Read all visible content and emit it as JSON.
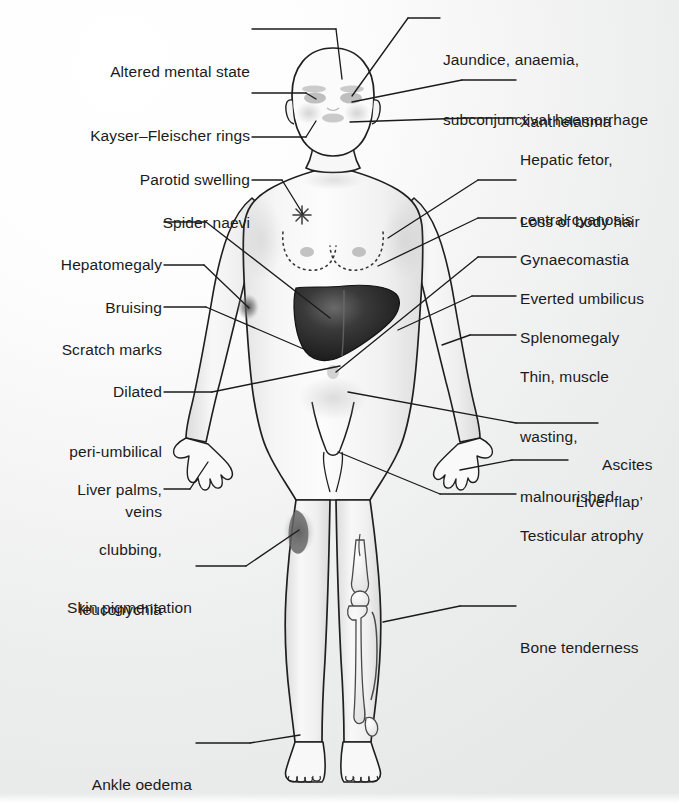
{
  "figure": {
    "background_color": "#ececec",
    "ink_color": "#1b1b1b",
    "skin_color": "#f7f7f7",
    "liver_color": "#2a2a2a"
  },
  "labels_left": [
    {
      "id": "altered-mental-state",
      "lines": [
        "Altered mental state"
      ],
      "x": 50,
      "y": 22,
      "width": 200
    },
    {
      "id": "kayser-fleischer-rings",
      "lines": [
        "Kayser–Fleischer rings"
      ],
      "x": 22,
      "y": 86,
      "width": 228
    },
    {
      "id": "parotid-swelling",
      "lines": [
        "Parotid swelling"
      ],
      "x": 92,
      "y": 130,
      "width": 158
    },
    {
      "id": "spider-naevi",
      "lines": [
        "Spider naevi"
      ],
      "x": 108,
      "y": 173,
      "width": 142
    },
    {
      "id": "hepatomegaly",
      "lines": [
        "Hepatomegaly"
      ],
      "x": 28,
      "y": 215,
      "width": 134
    },
    {
      "id": "bruising",
      "lines": [
        "Bruising"
      ],
      "x": 74,
      "y": 258,
      "width": 88
    },
    {
      "id": "scratch-marks",
      "lines": [
        "Scratch marks"
      ],
      "x": 28,
      "y": 300,
      "width": 134
    },
    {
      "id": "dilated-peri-umbilical-veins",
      "lines": [
        "Dilated",
        "peri-umbilical",
        "veins"
      ],
      "x": 28,
      "y": 342,
      "width": 134
    },
    {
      "id": "liver-palms-clubbing-leuconychia",
      "lines": [
        "Liver palms,",
        "clubbing,",
        "leuconychia"
      ],
      "x": 40,
      "y": 440,
      "width": 122
    },
    {
      "id": "skin-pigmentation",
      "lines": [
        "Skin pigmentation"
      ],
      "x": 52,
      "y": 558,
      "width": 140
    },
    {
      "id": "ankle-oedema",
      "lines": [
        "Ankle oedema"
      ],
      "x": 80,
      "y": 735,
      "width": 112
    }
  ],
  "labels_right": [
    {
      "id": "jaundice-anaemia-subconjunctival-haemorrhage",
      "lines": [
        "Jaundice, anaemia,",
        "subconjunctival haemorrhage"
      ],
      "x": 443,
      "y": 10
    },
    {
      "id": "xanthelasma",
      "lines": [
        "Xanthelasma"
      ],
      "x": 520,
      "y": 72
    },
    {
      "id": "hepatic-fetor-central-cyanosis",
      "lines": [
        "Hepatic fetor,",
        "central cyanosis"
      ],
      "x": 520,
      "y": 110
    },
    {
      "id": "loss-of-body-hair",
      "lines": [
        "Loss of body hair"
      ],
      "x": 520,
      "y": 172
    },
    {
      "id": "gynaecomastia",
      "lines": [
        "Gynaecomastia"
      ],
      "x": 520,
      "y": 210
    },
    {
      "id": "everted-umbilicus",
      "lines": [
        "Everted umbilicus"
      ],
      "x": 520,
      "y": 249
    },
    {
      "id": "splenomegaly",
      "lines": [
        "Splenomegaly"
      ],
      "x": 520,
      "y": 288
    },
    {
      "id": "thin-muscle-wasting-malnourished",
      "lines": [
        "Thin, muscle",
        "wasting,",
        "malnourished"
      ],
      "x": 520,
      "y": 327
    },
    {
      "id": "ascites",
      "lines": [
        "Ascites"
      ],
      "x": 602,
      "y": 415
    },
    {
      "id": "liver-flap",
      "lines": [
        "‘Liver flap’"
      ],
      "x": 572,
      "y": 452
    },
    {
      "id": "testicular-atrophy",
      "lines": [
        "Testicular atrophy"
      ],
      "x": 520,
      "y": 486
    },
    {
      "id": "bone-tenderness",
      "lines": [
        "Bone tenderness"
      ],
      "x": 520,
      "y": 598
    }
  ],
  "anatomy_markers": [
    {
      "id": "spider-naevus-mark",
      "description": "star shaped spider naevus on upper chest"
    },
    {
      "id": "bruise-mark",
      "description": "dark bruise on left forearm"
    },
    {
      "id": "liver-organ",
      "description": "enlarged liver shaded dark in right upper quadrant"
    },
    {
      "id": "gynaecomastia-outline",
      "description": "dotted outline around both breasts"
    },
    {
      "id": "pigmentation-patch",
      "description": "dark pigmented patch on left thigh"
    },
    {
      "id": "leg-bones",
      "description": "femur, patella, tibia and fibula outlined in right leg"
    }
  ]
}
